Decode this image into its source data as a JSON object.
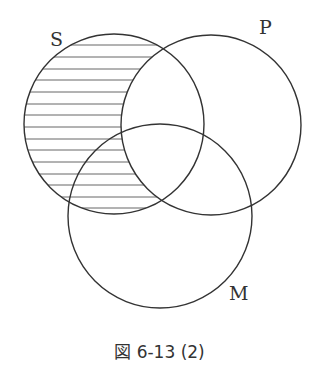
{
  "diagram": {
    "type": "venn",
    "caption": "図 6-13 (2)",
    "sets": [
      {
        "name": "S",
        "label": "S",
        "cx": 114,
        "cy": 124,
        "r": 90
      },
      {
        "name": "P",
        "label": "P",
        "cx": 211,
        "cy": 125,
        "r": 90
      },
      {
        "name": "M",
        "label": "M",
        "cx": 160,
        "cy": 216,
        "r": 92
      }
    ],
    "shaded_region": "S minus P (horizontal hatching)",
    "colors": {
      "stroke": "#333333",
      "hatch": "#666666",
      "background": "#ffffff"
    }
  }
}
